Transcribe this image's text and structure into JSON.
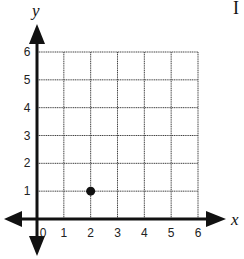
{
  "chart_data": {
    "type": "scatter",
    "title": "",
    "xlabel": "x",
    "ylabel": "y",
    "xlim": [
      0,
      6
    ],
    "ylim": [
      0,
      6
    ],
    "x_ticks": [
      "0",
      "1",
      "2",
      "3",
      "4",
      "5",
      "6"
    ],
    "y_ticks": [
      "1",
      "2",
      "3",
      "4",
      "5",
      "6"
    ],
    "grid": true,
    "axes_arrows": true,
    "legend": null,
    "series": [
      {
        "name": "point",
        "points": [
          {
            "x": 2,
            "y": 1
          }
        ]
      }
    ]
  },
  "labels": {
    "x_axis": "x",
    "y_axis": "y",
    "x_ticks": [
      "0",
      "1",
      "2",
      "3",
      "4",
      "5",
      "6"
    ],
    "y_ticks": [
      "1",
      "2",
      "3",
      "4",
      "5",
      "6"
    ]
  },
  "colors": {
    "axis": "#111111",
    "grid": "#444444",
    "point": "#111111"
  }
}
